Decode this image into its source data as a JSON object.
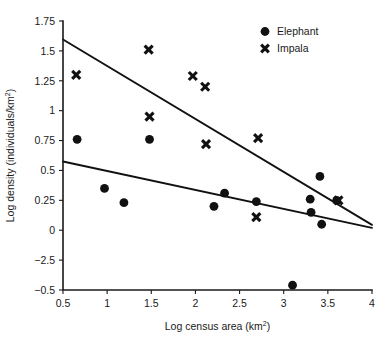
{
  "chart_data": {
    "type": "scatter",
    "title": "",
    "xlabel": "Log census area (km2)",
    "xlabel_base": "Log census area (km",
    "xlabel_sup": "2",
    "xlabel_tail": ")",
    "ylabel": "Log density (individuals/km2)",
    "ylabel_base": "Log density (individuals/km",
    "ylabel_sup": "2",
    "ylabel_tail": ")",
    "xlim": [
      0.5,
      4
    ],
    "ylim": [
      -0.5,
      1.75
    ],
    "grid": false,
    "xticks": [
      0.5,
      1,
      1.5,
      2,
      2.5,
      3,
      3.5,
      4
    ],
    "xtick_labels": [
      "0.5",
      "1",
      "1.5",
      "2",
      "2.5",
      "3",
      "3.5",
      "4"
    ],
    "yticks": [
      -0.5,
      -0.25,
      0,
      0.25,
      0.5,
      0.75,
      1,
      1.25,
      1.5,
      1.75
    ],
    "ytick_labels": [
      "−0.5",
      "−2.5",
      "0",
      "0.25",
      "0.5",
      "0.75",
      "1",
      "1.25",
      "1.5",
      "1.75"
    ],
    "ytick_labels_note": "As printed in the figure: the tick between 0 and −0.5 is mislabelled −2.5 (should be −0.25)",
    "legend_position": "top-right",
    "series": [
      {
        "name": "Elephant",
        "marker": "circle",
        "color": "#111111",
        "points": [
          [
            0.66,
            0.76
          ],
          [
            0.97,
            0.35
          ],
          [
            1.19,
            0.23
          ],
          [
            1.48,
            0.76
          ],
          [
            2.21,
            0.2
          ],
          [
            2.33,
            0.31
          ],
          [
            2.69,
            0.24
          ],
          [
            3.1,
            -0.46
          ],
          [
            3.3,
            0.26
          ],
          [
            3.31,
            0.15
          ],
          [
            3.41,
            0.45
          ],
          [
            3.43,
            0.05
          ],
          [
            3.6,
            0.25
          ]
        ]
      },
      {
        "name": "Impala",
        "marker": "x",
        "color": "#111111",
        "points": [
          [
            0.65,
            1.3
          ],
          [
            1.47,
            1.51
          ],
          [
            1.48,
            0.95
          ],
          [
            1.97,
            1.29
          ],
          [
            2.11,
            1.2
          ],
          [
            2.12,
            0.72
          ],
          [
            2.69,
            0.11
          ],
          [
            2.71,
            0.77
          ],
          [
            3.62,
            0.25
          ]
        ]
      }
    ],
    "fit_lines": [
      {
        "series": "Impala",
        "x0": 0.5,
        "y0": 1.595,
        "x1": 4.0,
        "y1": 0.045
      },
      {
        "series": "Elephant",
        "x0": 0.5,
        "y0": 0.575,
        "x1": 4.0,
        "y1": 0.02
      }
    ]
  },
  "legend": {
    "entries": [
      {
        "label": "Elephant",
        "marker": "circle"
      },
      {
        "label": "Impala",
        "marker": "x"
      }
    ]
  }
}
